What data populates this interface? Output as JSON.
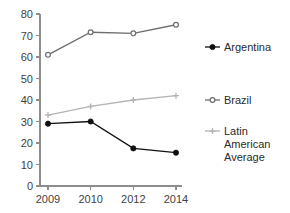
{
  "chart_data": {
    "type": "line",
    "title": "",
    "subtitle": "",
    "xlabel": "",
    "ylabel": "",
    "categories": [
      "2009",
      "2010",
      "2012",
      "2014"
    ],
    "x_tick_labels": [
      "2009",
      "2010",
      "2012",
      "2014"
    ],
    "y_tick_labels": [
      "0",
      "10",
      "20",
      "30",
      "40",
      "50",
      "60",
      "70",
      "80"
    ],
    "y_ticks": [
      0,
      10,
      20,
      30,
      40,
      50,
      60,
      70,
      80
    ],
    "ylim": [
      0,
      80
    ],
    "grid": false,
    "legend_position": "right",
    "series": [
      {
        "name": "Argentina",
        "color": "#111111",
        "marker": "circle-filled",
        "values": [
          29,
          30,
          17.5,
          15.5
        ]
      },
      {
        "name": "Brazil",
        "color": "#6e6e6e",
        "marker": "circle-open",
        "values": [
          61,
          71.5,
          71,
          75
        ]
      },
      {
        "name": "Latin American Average",
        "color": "#b4b4b4",
        "marker": "plus",
        "values": [
          33,
          37,
          40,
          42
        ]
      }
    ]
  },
  "legend": {
    "entries": [
      {
        "label": "Argentina",
        "lines": [
          "Argentina"
        ]
      },
      {
        "label": "Brazil",
        "lines": [
          "Brazil"
        ]
      },
      {
        "label": "Latin American Average",
        "lines": [
          "Latin",
          "American",
          "Average"
        ]
      }
    ]
  },
  "colors": {
    "argentina": "#111111",
    "brazil": "#6e6e6e",
    "latin_american_average": "#b4b4b4",
    "axis": "#8d8d8d",
    "text": "#3f3f3f",
    "background": "#ffffff"
  }
}
